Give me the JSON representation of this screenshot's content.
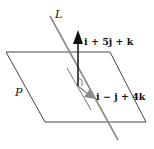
{
  "diagram": {
    "plane_label": "P",
    "line_label": "L",
    "normal_vector_label": "i + 5j + k",
    "direction_vector_label": "i − j + 4k",
    "colors": {
      "plane_edge": "#444444",
      "line": "#8a8a8a",
      "normal_arrow": "#111111",
      "direction_arrow": "#8a8a8a",
      "text": "#111111"
    }
  }
}
